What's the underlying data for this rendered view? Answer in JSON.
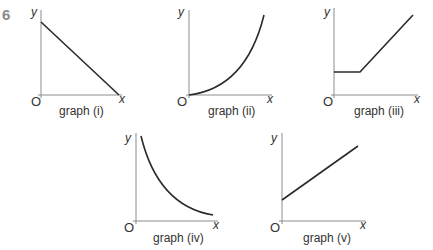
{
  "question_number": "6",
  "axis_labels": {
    "x": "x",
    "y": "y",
    "origin": "O"
  },
  "graphs": [
    {
      "id": "i",
      "label": "graph (i)",
      "shape": "straight line, negative gradient, positive y-intercept, meets x-axis"
    },
    {
      "id": "ii",
      "label": "graph (ii)",
      "shape": "curve through origin, increasing gradient"
    },
    {
      "id": "iii",
      "label": "graph (iii)",
      "shape": "horizontal segment then straight line with positive gradient"
    },
    {
      "id": "iv",
      "label": "graph (iv)",
      "shape": "decreasing curve approaching x-axis (inverse)"
    },
    {
      "id": "v",
      "label": "graph (v)",
      "shape": "straight line, positive gradient, positive y-intercept"
    }
  ],
  "colors": {
    "axis": "#8c8c8c",
    "curve": "#2a2a2a",
    "text": "#333333",
    "question_number": "#8a8a8a"
  }
}
